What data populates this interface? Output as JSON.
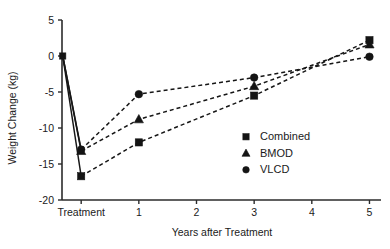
{
  "chart_data": {
    "type": "line",
    "title": "",
    "xlabel": "Years after Treatment",
    "ylabel": "Weight Change (kg)",
    "x_tick_labels": [
      "Treatment",
      "1",
      "2",
      "3",
      "4",
      "5"
    ],
    "x_tick_values": [
      0,
      1,
      2,
      3,
      4,
      5
    ],
    "xlim": [
      -0.35,
      5.2
    ],
    "y_tick_labels": [
      "5",
      "0",
      "-5",
      "-10",
      "-15",
      "-20"
    ],
    "y_tick_values": [
      5,
      0,
      -5,
      -10,
      -15,
      -20
    ],
    "ylim": [
      -20,
      5
    ],
    "grid": false,
    "legend_position": "center-right",
    "x_baseline_label": "Baseline",
    "series": [
      {
        "name": "Combined",
        "marker": "square",
        "x": [
          -0.32,
          0,
          1,
          3,
          5
        ],
        "values": [
          0,
          -16.7,
          -12.0,
          -5.5,
          2.2
        ]
      },
      {
        "name": "BMOD",
        "marker": "triangle",
        "x": [
          -0.32,
          0,
          1,
          3,
          5
        ],
        "values": [
          0,
          -13.2,
          -8.8,
          -4.2,
          1.6
        ]
      },
      {
        "name": "VLCD",
        "marker": "circle",
        "x": [
          -0.32,
          0,
          1,
          3,
          5
        ],
        "values": [
          0,
          -13.0,
          -5.3,
          -3.0,
          -0.1
        ]
      }
    ]
  },
  "legend": {
    "entries": [
      {
        "label": "Combined",
        "marker": "square"
      },
      {
        "label": "BMOD",
        "marker": "triangle"
      },
      {
        "label": "VLCD",
        "marker": "circle"
      }
    ]
  },
  "colors": {
    "ink": "#141414",
    "axis": "#2b2b2b",
    "background": "#ffffff"
  }
}
